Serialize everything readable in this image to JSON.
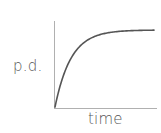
{
  "chart_data": {
    "type": "line",
    "title": "",
    "xlabel": "time",
    "ylabel": "p.d.",
    "x_ticks": [],
    "y_ticks": [],
    "grid": false,
    "legend": null,
    "series": [
      {
        "name": "p.d.",
        "function": "V = V0 * (1 - exp(-t / tau))",
        "x": [
          0,
          0.1,
          0.2,
          0.3,
          0.4,
          0.5,
          0.6,
          0.7,
          0.8,
          0.9,
          1.0
        ],
        "values": [
          0,
          0.63,
          0.86,
          0.95,
          0.98,
          0.99,
          1.0,
          1.0,
          1.0,
          1.0,
          1.0
        ]
      }
    ],
    "xlim": [
      0,
      1
    ],
    "ylim": [
      0,
      1.15
    ]
  },
  "colors": {
    "axis": "#aaaaaa",
    "curve": "#555555",
    "text": "#555555"
  }
}
